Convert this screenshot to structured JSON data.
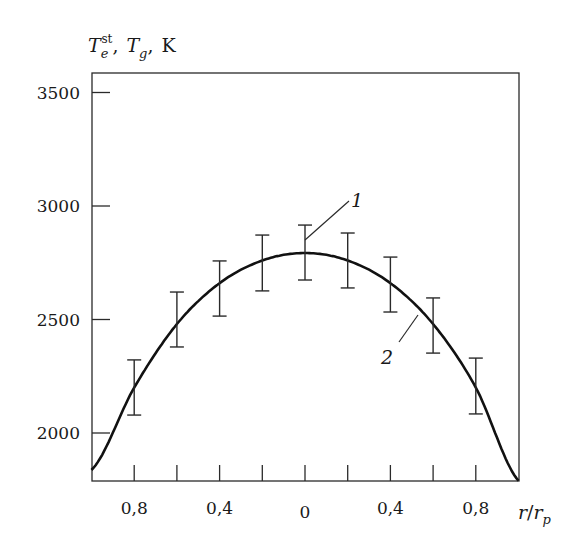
{
  "chart_data": {
    "type": "line",
    "title": "",
    "ylabel": "T_e^st, T_g, K",
    "ylabel_parts": {
      "t1": "T",
      "t1_sub": "e",
      "t1_sup": "st",
      "sep1": ",",
      "t2": "T",
      "t2_sub": "g",
      "sep2": ",",
      "unit": "K"
    },
    "xlabel": "r/r_p",
    "xlabel_parts": {
      "r": "r",
      "slash": "/",
      "rp": "r",
      "rp_sub": "p"
    },
    "xlim": [
      -1.0,
      1.0
    ],
    "ylim": [
      1790,
      3660
    ],
    "grid": false,
    "legend": "none (curves labeled inline with numbers 1 and 2)",
    "x_ticks": [
      -0.8,
      -0.6,
      -0.4,
      -0.2,
      0,
      0.2,
      0.4,
      0.6,
      0.8
    ],
    "x_tick_labels": [
      {
        "x": -0.8,
        "label": "0,8"
      },
      {
        "x": -0.4,
        "label": "0,4"
      },
      {
        "x": 0,
        "label": "0"
      },
      {
        "x": 0.4,
        "label": "0,4"
      },
      {
        "x": 0.8,
        "label": "0,8"
      }
    ],
    "y_ticks": [
      2000,
      2500,
      3000,
      3500
    ],
    "y_tick_labels": [
      "2000",
      "2500",
      "3000",
      "3500"
    ],
    "series": [
      {
        "name": "1",
        "description": "T_e^st measured values with error bars",
        "style": "error bars",
        "x": [
          -0.8,
          -0.6,
          -0.4,
          -0.2,
          0,
          0.2,
          0.4,
          0.6,
          0.8
        ],
        "values": [
          2200,
          2500,
          2636,
          2749,
          2795,
          2760,
          2654,
          2474,
          2207
        ],
        "err_low": [
          2079,
          2379,
          2515,
          2626,
          2674,
          2639,
          2533,
          2352,
          2084
        ],
        "err_high": [
          2322,
          2621,
          2758,
          2872,
          2916,
          2881,
          2775,
          2595,
          2330
        ]
      },
      {
        "name": "2",
        "description": "T_g smooth profile",
        "style": "solid curve",
        "x": [
          -1.0,
          -0.8,
          -0.6,
          -0.4,
          -0.2,
          0,
          0.2,
          0.4,
          0.6,
          0.8,
          1.0
        ],
        "values": [
          1837,
          2200,
          2480,
          2660,
          2760,
          2793,
          2760,
          2660,
          2480,
          2200,
          1790
        ]
      }
    ],
    "annotations": [
      {
        "text": "1",
        "points_to": "error bar at r=0"
      },
      {
        "text": "2",
        "points_to": "curve near r=0.5"
      }
    ]
  }
}
